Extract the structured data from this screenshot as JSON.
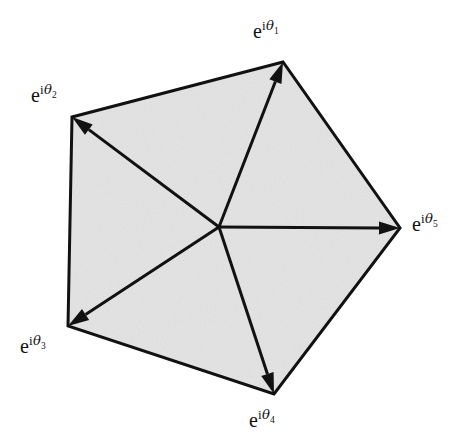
{
  "figure": {
    "type": "vector-polygon-diagram",
    "canvas": {
      "width": 465,
      "height": 448
    },
    "colors": {
      "background": "#ffffff",
      "polygon_fill": "#e3e3e3",
      "stroke": "#111111",
      "label_text": "#111111"
    },
    "center": {
      "x": 219,
      "y": 227
    },
    "stroke_width_outline": 3.0,
    "stroke_width_arrow": 3.0
  },
  "chart_data": {
    "type": "scatter",
    "title": "",
    "xlabel": "",
    "ylabel": "",
    "grid": false,
    "legend": false,
    "annotations": [
      "Arrows originate at the common center point and terminate at each pentagon vertex."
    ],
    "center": {
      "x": 219,
      "y": 227
    },
    "vertices": [
      {
        "id": 1,
        "label": "e^{iθ1}",
        "base": "e",
        "imag": "i",
        "theta": "θ",
        "index": "1",
        "x": 283,
        "y": 62,
        "label_x": 253,
        "label_y": 21,
        "angle_deg": 69.0
      },
      {
        "id": 2,
        "label": "e^{iθ2}",
        "base": "e",
        "imag": "i",
        "theta": "θ",
        "index": "2",
        "x": 72,
        "y": 117,
        "label_x": 31,
        "label_y": 85,
        "angle_deg": 151.0
      },
      {
        "id": 3,
        "label": "e^{iθ3}",
        "base": "e",
        "imag": "i",
        "theta": "θ",
        "index": "3",
        "x": 68,
        "y": 326,
        "label_x": 20,
        "label_y": 336,
        "angle_deg": 213.0
      },
      {
        "id": 4,
        "label": "e^{iθ4}",
        "base": "e",
        "imag": "i",
        "theta": "θ",
        "index": "4",
        "x": 274,
        "y": 394,
        "label_x": 249,
        "label_y": 410,
        "angle_deg": 286.0
      },
      {
        "id": 5,
        "label": "e^{iθ5}",
        "base": "e",
        "imag": "i",
        "theta": "θ",
        "index": "5",
        "x": 400,
        "y": 228,
        "label_x": 412,
        "label_y": 214,
        "angle_deg": 0.0
      }
    ],
    "edges": [
      {
        "from": 1,
        "to": 2
      },
      {
        "from": 2,
        "to": 3
      },
      {
        "from": 3,
        "to": 4
      },
      {
        "from": 4,
        "to": 5
      },
      {
        "from": 5,
        "to": 1
      }
    ]
  }
}
